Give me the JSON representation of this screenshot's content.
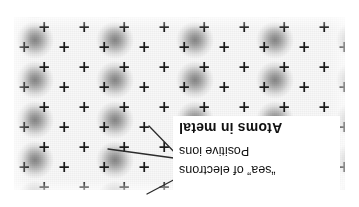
{
  "figure": {
    "title": "Atoms in metal",
    "orientation": "rotated-180",
    "background_color": "#ffffff"
  },
  "callout": {
    "box_background": "#ffffff",
    "labels": [
      {
        "id": "sea",
        "text": "“sea” of electrons",
        "bold": false
      },
      {
        "id": "ions",
        "text": "Positive ions",
        "bold": false
      },
      {
        "id": "title",
        "text": "Atoms in metal",
        "bold": true
      }
    ]
  },
  "leader_lines": [
    {
      "name": "leader-to-electron-sea",
      "from": [
        178,
        31
      ],
      "to": [
        212,
        13
      ],
      "color": "#2b2b2b"
    },
    {
      "name": "leader-to-positive-ion",
      "from": [
        178,
        48
      ],
      "to": [
        251,
        58
      ],
      "color": "#2b2b2b"
    },
    {
      "name": "leader-to-positive-ion-2",
      "from": [
        178,
        48
      ],
      "to": [
        210,
        81
      ],
      "color": "#2b2b2b"
    }
  ],
  "lattice": {
    "description": "Close-packed metal lattice: grey electron-density blobs with positive ion cores marked by plus signs",
    "ion_symbol": "+",
    "ion_color": "#1b1b1b",
    "blob_center_color": "#878787",
    "blob_edge_color": "#f8f8f8",
    "field": {
      "x": 14,
      "y": 17,
      "width": 331,
      "height": 173
    },
    "spacing": {
      "column": 40,
      "row": 20,
      "stagger_x": 20
    },
    "ions": [
      [
        20,
        3
      ],
      [
        60,
        3
      ],
      [
        100,
        3
      ],
      [
        140,
        3
      ],
      [
        180,
        3
      ],
      [
        220,
        3
      ],
      [
        260,
        3
      ],
      [
        300,
        3
      ],
      [
        0,
        23
      ],
      [
        40,
        23
      ],
      [
        80,
        23
      ],
      [
        120,
        23
      ],
      [
        160,
        23
      ],
      [
        200,
        23
      ],
      [
        240,
        23
      ],
      [
        280,
        23
      ],
      [
        320,
        23
      ],
      [
        20,
        43
      ],
      [
        60,
        43
      ],
      [
        100,
        43
      ],
      [
        140,
        43
      ],
      [
        180,
        43
      ],
      [
        220,
        43
      ],
      [
        260,
        43
      ],
      [
        300,
        43
      ],
      [
        0,
        63
      ],
      [
        40,
        63
      ],
      [
        80,
        63
      ],
      [
        120,
        63
      ],
      [
        160,
        63
      ],
      [
        200,
        63
      ],
      [
        240,
        63
      ],
      [
        280,
        63
      ],
      [
        320,
        63
      ],
      [
        20,
        83
      ],
      [
        60,
        83
      ],
      [
        100,
        83
      ],
      [
        140,
        83
      ],
      [
        180,
        83
      ],
      [
        220,
        83
      ],
      [
        260,
        83
      ],
      [
        300,
        83
      ],
      [
        0,
        103
      ],
      [
        40,
        103
      ],
      [
        80,
        103
      ],
      [
        120,
        103
      ],
      [
        160,
        103
      ],
      [
        200,
        103
      ],
      [
        240,
        103
      ],
      [
        280,
        103
      ],
      [
        320,
        103
      ],
      [
        20,
        123
      ],
      [
        60,
        123
      ],
      [
        100,
        123
      ],
      [
        140,
        123
      ],
      [
        180,
        123
      ],
      [
        220,
        123
      ],
      [
        260,
        123
      ],
      [
        300,
        123
      ],
      [
        0,
        143
      ],
      [
        40,
        143
      ],
      [
        80,
        143
      ],
      [
        120,
        143
      ],
      [
        160,
        143
      ],
      [
        200,
        143
      ],
      [
        240,
        143
      ],
      [
        280,
        143
      ],
      [
        320,
        143
      ],
      [
        20,
        163
      ],
      [
        60,
        163
      ],
      [
        100,
        163
      ],
      [
        140,
        163
      ],
      [
        180,
        163
      ],
      [
        220,
        163
      ],
      [
        260,
        163
      ],
      [
        300,
        163
      ]
    ]
  }
}
